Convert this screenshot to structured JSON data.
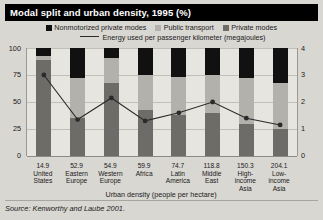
{
  "title": "Modal split and urban density, 1995 (%)",
  "legend": {
    "items": [
      {
        "label": "Nonmotorized private modes",
        "color": "#111111"
      },
      {
        "label": "Public transport",
        "color": "#b3b1ab"
      },
      {
        "label": "Private modes",
        "color": "#6e6c68"
      }
    ],
    "line_label": "Energy used per passenger kilometer (megajoules)",
    "line_color": "#2b2b2b"
  },
  "axes": {
    "left_ticks": [
      "100",
      "75",
      "50",
      "25",
      "0"
    ],
    "right_ticks": [
      "4",
      "3",
      "2",
      "1",
      "0"
    ],
    "xlabel": "Urban density (people per hectare)",
    "ylim": [
      0,
      100
    ],
    "y2lim": [
      0,
      4
    ]
  },
  "source": "Source: Kenworthy and Laube 2001.",
  "chart_data": {
    "type": "bar",
    "title": "Modal split and urban density, 1995 (%)",
    "xlabel": "Urban density (people per hectare)",
    "ylabel": "",
    "ylim": [
      0,
      100
    ],
    "y2lim": [
      0,
      4
    ],
    "grid": true,
    "legend_position": "top",
    "categories": [
      "United States",
      "Eastern Europe",
      "Western Europe",
      "Africa",
      "Latin America",
      "Middle East",
      "High-income Asia",
      "Low-income Asia"
    ],
    "density_labels": [
      "14.9",
      "52.9",
      "54.9",
      "59.9",
      "74.7",
      "118.8",
      "150.3",
      "204.1"
    ],
    "series": [
      {
        "name": "Private modes",
        "values": [
          89,
          35,
          68,
          43,
          38,
          40,
          30,
          25
        ]
      },
      {
        "name": "Public transport",
        "values": [
          4,
          37,
          23,
          32,
          35,
          35,
          42,
          43
        ]
      },
      {
        "name": "Nonmotorized private modes",
        "values": [
          7,
          28,
          9,
          25,
          27,
          25,
          28,
          32
        ]
      }
    ],
    "line_series": {
      "name": "Energy used per passenger kilometer (megajoules)",
      "values": [
        3.0,
        1.35,
        2.15,
        1.3,
        1.6,
        2.0,
        1.4,
        1.15
      ]
    }
  }
}
